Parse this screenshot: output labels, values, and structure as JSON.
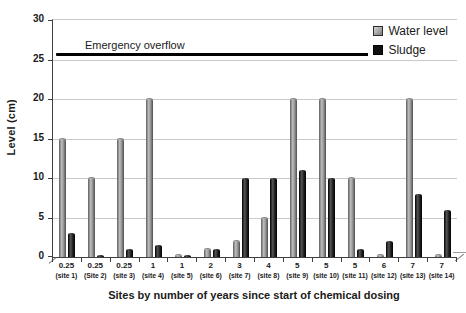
{
  "chart_data": {
    "type": "bar",
    "title": "",
    "xlabel": "Sites by number of years since start of chemical dosing",
    "ylabel": "Level (cm)",
    "ylim": [
      0,
      30
    ],
    "yticks": [
      0,
      5,
      10,
      15,
      20,
      25,
      30
    ],
    "grid": true,
    "legend_position": "top-right-inside",
    "categories_years": [
      "0.25",
      "0.25",
      "0.25",
      "1",
      "1",
      "2",
      "3",
      "4",
      "5",
      "5",
      "5",
      "6",
      "7",
      "7"
    ],
    "categories_sites": [
      "(site 1)",
      "(Site 2)",
      "(site 3)",
      "(site 4)",
      "(site 5)",
      "(site 6)",
      "(site 7)",
      "(site 8)",
      "(site 9)",
      "(site 10)",
      "(site 11)",
      "(site 12)",
      "(site 13)",
      "(site 14)"
    ],
    "series": [
      {
        "name": "Water level",
        "color": "#9b9b9b",
        "values": [
          15,
          10,
          15,
          20,
          0.2,
          1,
          2,
          5,
          20,
          20,
          10,
          0.2,
          20,
          0.2
        ]
      },
      {
        "name": "Sludge",
        "color": "#111111",
        "values": [
          3,
          0.2,
          1,
          1.5,
          0.2,
          1,
          10,
          10,
          11,
          10,
          1,
          2,
          8,
          6
        ]
      }
    ],
    "annotation": {
      "label": "Emergency overflow",
      "value": 25.5
    },
    "colors": {
      "water_bar": "#9b9b9b",
      "sludge_bar": "#111111",
      "gridline": "#c9c9c9",
      "axis": "#3f3f3f",
      "emergency_line": "#000000",
      "background": "#ffffff"
    }
  }
}
